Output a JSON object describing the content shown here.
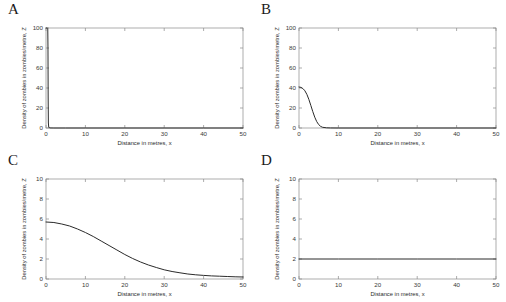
{
  "figure": {
    "background": "#ffffff",
    "curve_color": "#2a2a2a",
    "axis_color": "#8a8a8a",
    "layout": "2x2 grid of line plots"
  },
  "panels": [
    {
      "letter": "A",
      "xlabel": "Distance in metres, x",
      "ylabel": "Density of zombies in zombies/metre, Z",
      "xticks": [
        0,
        10,
        20,
        30,
        40,
        50
      ],
      "yticks": [
        0,
        20,
        40,
        60,
        80,
        100
      ]
    },
    {
      "letter": "B",
      "xlabel": "Distance in metres, x",
      "ylabel": "Density of zombies in zombies/metre, Z",
      "xticks": [
        0,
        10,
        20,
        30,
        40,
        50
      ],
      "yticks": [
        0,
        20,
        40,
        60,
        80,
        100
      ]
    },
    {
      "letter": "C",
      "xlabel": "Distance in metres, x",
      "ylabel": "Density of zombies in zombies/metre, Z",
      "xticks": [
        0,
        10,
        20,
        30,
        40,
        50
      ],
      "yticks": [
        0,
        2,
        4,
        6,
        8,
        10
      ]
    },
    {
      "letter": "D",
      "xlabel": "Distance in metres, x",
      "ylabel": "Density of zombies in zombies/metre, Z",
      "xticks": [
        0,
        10,
        20,
        30,
        40,
        50
      ],
      "yticks": [
        0,
        2,
        4,
        6,
        8,
        10
      ]
    }
  ],
  "chart_data": [
    {
      "type": "line",
      "panel": "A",
      "title": "A",
      "xlabel": "Distance in metres, x",
      "ylabel": "Density of zombies in zombies/metre, Z",
      "xlim": [
        0,
        50
      ],
      "ylim": [
        0,
        100
      ],
      "xticks": [
        0,
        10,
        20,
        30,
        40,
        50
      ],
      "yticks": [
        0,
        20,
        40,
        60,
        80,
        100
      ],
      "grid": false,
      "legend": "none",
      "description": "Near-vertical front: density holds at 100 then drops abruptly to 0 just after x = 0.5",
      "x": [
        0,
        0.3,
        0.45,
        0.5,
        0.55,
        0.6,
        0.7,
        1,
        2,
        5,
        10,
        20,
        30,
        40,
        50
      ],
      "values": [
        100,
        100,
        99.5,
        80,
        30,
        5,
        0.6,
        0.05,
        0,
        0,
        0,
        0,
        0,
        0,
        0
      ]
    },
    {
      "type": "line",
      "panel": "B",
      "title": "B",
      "xlabel": "Distance in metres, x",
      "ylabel": "Density of zombies in zombies/metre, Z",
      "xlim": [
        0,
        50
      ],
      "ylim": [
        0,
        100
      ],
      "xticks": [
        0,
        10,
        20,
        30,
        40,
        50
      ],
      "yticks": [
        0,
        20,
        40,
        60,
        80,
        100
      ],
      "grid": false,
      "legend": "none",
      "description": "Starts near 41 at x = 0, plateaus briefly then falls in a sigmoid to zero by about x = 6",
      "x": [
        0,
        0.5,
        1,
        1.5,
        2,
        2.5,
        3,
        3.5,
        4,
        4.5,
        5,
        5.5,
        6,
        7,
        8,
        10,
        20,
        30,
        40,
        50
      ],
      "values": [
        41,
        40.6,
        39.4,
        37.2,
        33.6,
        28.6,
        22.6,
        16.4,
        10.8,
        6.4,
        3.4,
        1.6,
        0.7,
        0.2,
        0.05,
        0,
        0,
        0,
        0,
        0
      ]
    },
    {
      "type": "line",
      "panel": "C",
      "title": "C",
      "xlabel": "Distance in metres, x",
      "ylabel": "Density of zombies in zombies/metre, Z",
      "xlim": [
        0,
        50
      ],
      "ylim": [
        0,
        10
      ],
      "xticks": [
        0,
        10,
        20,
        30,
        40,
        50
      ],
      "yticks": [
        0,
        2,
        4,
        6,
        8,
        10
      ],
      "grid": false,
      "legend": "none",
      "description": "Starts near 5.7, broad smooth sigmoid decay crossing 3 near x = 20 and tailing to about 0.2 at x = 50",
      "x": [
        0,
        2,
        4,
        6,
        8,
        10,
        12,
        14,
        16,
        18,
        20,
        22,
        24,
        26,
        28,
        30,
        32,
        34,
        36,
        38,
        40,
        42,
        44,
        46,
        48,
        50
      ],
      "values": [
        5.7,
        5.65,
        5.5,
        5.3,
        5.0,
        4.65,
        4.25,
        3.8,
        3.35,
        2.9,
        2.45,
        2.05,
        1.7,
        1.4,
        1.15,
        0.92,
        0.75,
        0.62,
        0.5,
        0.42,
        0.36,
        0.31,
        0.28,
        0.25,
        0.22,
        0.2
      ]
    },
    {
      "type": "line",
      "panel": "D",
      "title": "D",
      "xlabel": "Distance in metres, x",
      "ylabel": "Density of zombies in zombies/metre, Z",
      "xlim": [
        0,
        50
      ],
      "ylim": [
        0,
        10
      ],
      "xticks": [
        0,
        10,
        20,
        30,
        40,
        50
      ],
      "yticks": [
        0,
        2,
        4,
        6,
        8,
        10
      ],
      "grid": false,
      "legend": "none",
      "description": "Constant uniform density: flat horizontal line at Z = 2 across the whole domain",
      "x": [
        0,
        10,
        20,
        30,
        40,
        50
      ],
      "values": [
        2,
        2,
        2,
        2,
        2,
        2
      ]
    }
  ]
}
